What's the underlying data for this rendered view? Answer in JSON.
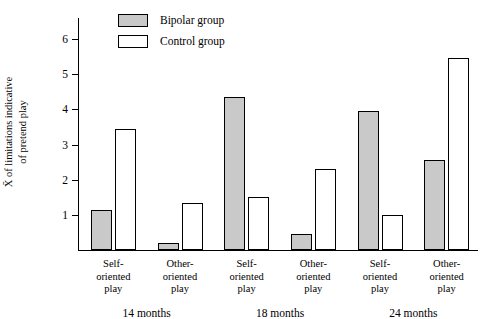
{
  "chart_data": {
    "type": "bar",
    "title": "",
    "xlabel": "",
    "ylabel": "X̄ of limitations indicative of pretend play",
    "ylim": [
      0,
      6.6
    ],
    "yticks": [
      1,
      2,
      3,
      4,
      5,
      6
    ],
    "ytick_labels": [
      "1",
      "2",
      "3",
      "4",
      "5",
      "6"
    ],
    "grid": false,
    "legend_position": "top-left",
    "categories": [
      "Self-oriented play",
      "Other-oriented play",
      "Self-oriented play",
      "Other-oriented play",
      "Self-oriented play",
      "Other-oriented play"
    ],
    "category_lines": [
      [
        "Self-",
        "oriented",
        "play"
      ],
      [
        "Other-",
        "oriented",
        "play"
      ],
      [
        "Self-",
        "oriented",
        "play"
      ],
      [
        "Other-",
        "oriented",
        "play"
      ],
      [
        "Self-",
        "oriented",
        "play"
      ],
      [
        "Other-",
        "oriented",
        "play"
      ]
    ],
    "groups": [
      {
        "label": "14 months",
        "categories": [
          0,
          1
        ]
      },
      {
        "label": "18 months",
        "categories": [
          2,
          3
        ]
      },
      {
        "label": "24 months",
        "categories": [
          4,
          5
        ]
      }
    ],
    "series": [
      {
        "name": "Bipolar group",
        "color": "#c9c9c9",
        "values": [
          1.15,
          0.2,
          4.35,
          0.45,
          3.95,
          2.55
        ]
      },
      {
        "name": "Control group",
        "color": "#ffffff",
        "values": [
          3.45,
          1.35,
          1.5,
          2.3,
          1.0,
          5.45
        ]
      }
    ]
  },
  "legend": {
    "items": [
      {
        "label": "Bipolar group",
        "swatch": "bipolar"
      },
      {
        "label": "Control group",
        "swatch": "control"
      }
    ]
  },
  "axis": {
    "y_title_line1": "X̄ of limitations indicative",
    "y_title_line2": "of pretend play"
  }
}
